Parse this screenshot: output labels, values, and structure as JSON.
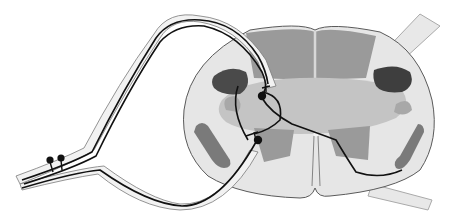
{
  "diagram": {
    "title": "",
    "labels": [],
    "colors": {
      "background": "#ffffff",
      "white_matter": "#e6e6e6",
      "outline": "#5a5a5a",
      "dorsal_columns": "#9a9a9a",
      "gray_matter": "#c4c4c4",
      "dark_tract": "#4a4a4a",
      "medium_gray": "#8a8a8a",
      "lateral_tract": "#7a7a7a",
      "nerve_sheath": "#f0f0f0",
      "neuron_line": "#111111"
    },
    "elements": [
      {
        "id": "spinal-cord",
        "type": "cross-section"
      },
      {
        "id": "dorsal-columns",
        "type": "region"
      },
      {
        "id": "gray-matter",
        "type": "region"
      },
      {
        "id": "left-dark-tract",
        "type": "region"
      },
      {
        "id": "right-dark-tract",
        "type": "region"
      },
      {
        "id": "left-lateral-tract",
        "type": "region"
      },
      {
        "id": "right-lateral-tract",
        "type": "region"
      },
      {
        "id": "ventral-fissure",
        "type": "line"
      },
      {
        "id": "spinal-nerve",
        "type": "nerve-bundle"
      },
      {
        "id": "dorsal-root",
        "type": "nerve-bundle"
      },
      {
        "id": "ventral-root",
        "type": "nerve-bundle"
      },
      {
        "id": "right-dorsal-root",
        "type": "nerve-bundle"
      },
      {
        "id": "right-ventral-root",
        "type": "nerve-bundle"
      },
      {
        "id": "ganglion-cells",
        "type": "cell-bodies",
        "count": 2
      },
      {
        "id": "interneuron-cell",
        "type": "cell-body"
      },
      {
        "id": "motor-neuron-cell",
        "type": "cell-body"
      }
    ]
  }
}
